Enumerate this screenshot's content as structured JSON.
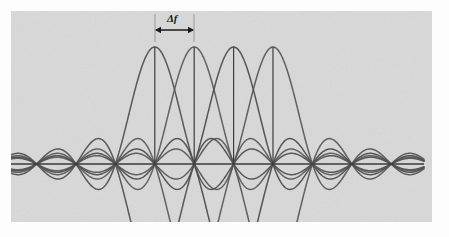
{
  "figure": {
    "background_color": "#d9d9d9",
    "paper_color": "#fdfdfd",
    "width": 449,
    "height": 237
  },
  "annotations": {
    "spacing_label": "Δf",
    "spacing_label_x": 167,
    "spacing_label_y": 13,
    "arrow_y": 30,
    "arrow_from_x": 155,
    "arrow_to_x": 194,
    "tick_top_y": 14,
    "tick_bottom_y": 34,
    "color": "#1a1a1a"
  },
  "axis": {
    "y": 164,
    "x_start": 11,
    "x_end": 424,
    "color": "#3a3a3a",
    "stroke_width": 1.6,
    "has_right_arrow": true
  },
  "chart_data": {
    "type": "line",
    "subtitle": "Overlapping sinc-shaped subcarriers separated by Δf",
    "xlabel": "",
    "ylabel": "",
    "grid": false,
    "legend_position": "none",
    "x_unit": "subcarrier spacing (Δf)",
    "zero_crossing_spacing_px": 39.4,
    "axis_baseline_px": 164,
    "peak_height_px": 117,
    "series": [
      {
        "name": "subcarrier-1",
        "color": "#4d4d4d",
        "peak_x_px": 154.8,
        "peak_y_px": 47,
        "function": "sinc",
        "center_index": 0
      },
      {
        "name": "subcarrier-2",
        "color": "#585858",
        "peak_x_px": 194.2,
        "peak_y_px": 47,
        "function": "sinc",
        "center_index": 1
      },
      {
        "name": "subcarrier-3",
        "color": "#4a4a4a",
        "peak_x_px": 233.6,
        "peak_y_px": 47,
        "function": "sinc",
        "center_index": 2
      },
      {
        "name": "subcarrier-4",
        "color": "#555555",
        "peak_x_px": 273.0,
        "peak_y_px": 47,
        "function": "sinc",
        "center_index": 3
      }
    ],
    "marker_lines": [
      {
        "name": "peak-marker-1",
        "x_px": 154.8,
        "y_top_px": 47,
        "y_bottom_px": 164
      },
      {
        "name": "peak-marker-2",
        "x_px": 194.2,
        "y_top_px": 47,
        "y_bottom_px": 164
      },
      {
        "name": "peak-marker-3",
        "x_px": 233.6,
        "y_top_px": 47,
        "y_bottom_px": 164
      },
      {
        "name": "peak-marker-4",
        "x_px": 273.0,
        "y_top_px": 47,
        "y_bottom_px": 164
      }
    ]
  }
}
